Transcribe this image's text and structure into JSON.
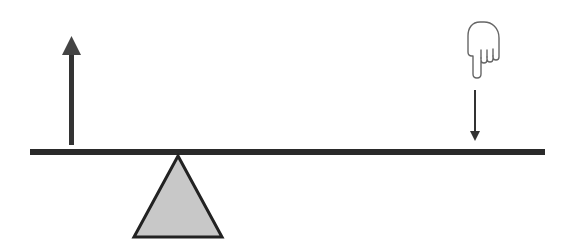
{
  "diagram": {
    "title": "",
    "type": "lever-seesaw",
    "colors": {
      "beam": "#2a2a2a",
      "fulcrum_fill": "#c8c8c8",
      "fulcrum_stroke": "#222222",
      "arrow_up": "#333333",
      "arrow_down": "#333333",
      "hand_stroke": "#666666"
    },
    "elements": [
      {
        "id": "beam",
        "label": "lever beam"
      },
      {
        "id": "fulcrum",
        "label": "fulcrum (triangle)"
      },
      {
        "id": "up-arrow",
        "label": "upward force on left end"
      },
      {
        "id": "down-arrow",
        "label": "downward force on right end"
      },
      {
        "id": "hand",
        "label": "pointing hand pressing down",
        "icon": "hand-pointing-down-icon"
      }
    ]
  }
}
